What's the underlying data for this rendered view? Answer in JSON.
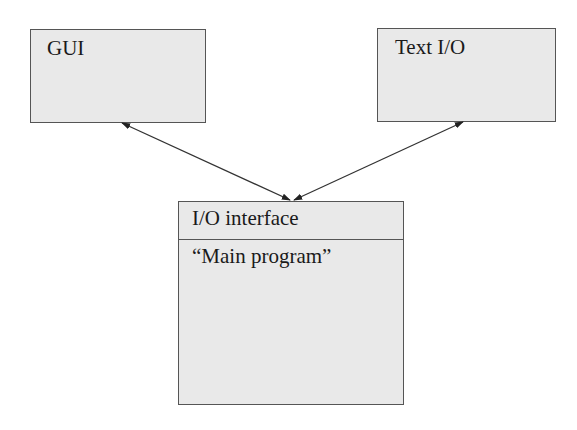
{
  "diagram": {
    "nodes": {
      "gui": {
        "label": "GUI"
      },
      "text_io": {
        "label": "Text I/O"
      },
      "main": {
        "header": "I/O interface",
        "body": "“Main program”"
      }
    },
    "edges": [
      {
        "from": "gui",
        "to": "main",
        "bidirectional": true
      },
      {
        "from": "text_io",
        "to": "main",
        "bidirectional": true
      }
    ],
    "colors": {
      "box_fill": "#e9e9e9",
      "stroke": "#555555",
      "text": "#1a1a1a"
    }
  }
}
